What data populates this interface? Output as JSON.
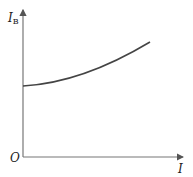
{
  "diagram": {
    "y_axis_label": "I",
    "y_axis_subscript": "B",
    "x_axis_label": "I",
    "origin_label": "O",
    "curve_description": "monotonically increasing, concave-up curve starting at nonzero y-intercept",
    "colors": {
      "axis": "#777777",
      "curve": "#444444",
      "text": "#222222"
    }
  }
}
